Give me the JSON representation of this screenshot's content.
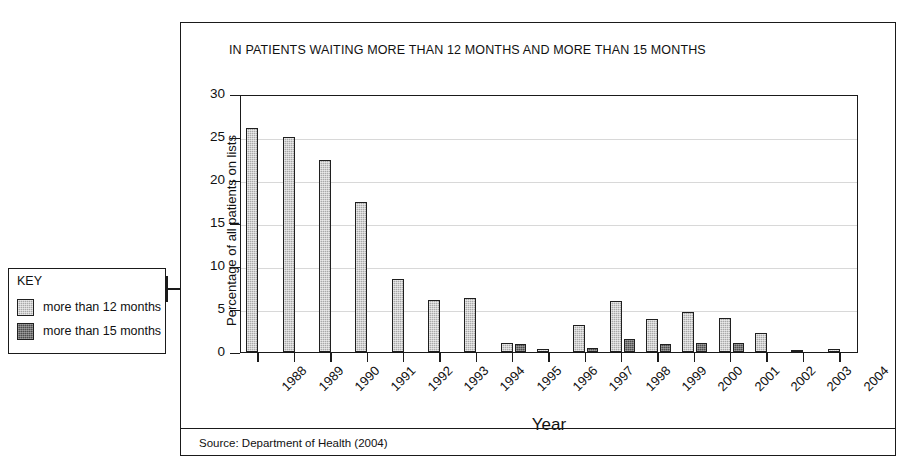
{
  "figure": {
    "title": "IN PATIENTS WAITING MORE THAN 12 MONTHS AND MORE THAN 15 MONTHS",
    "source_note": "Source: Department of Health (2004)"
  },
  "key": {
    "heading": "KEY",
    "items": [
      {
        "label": "more than 12 months",
        "color": "#a9a9a9"
      },
      {
        "label": "more than 15 months",
        "color": "#4c4c4c"
      }
    ]
  },
  "chart_data": {
    "type": "bar",
    "title": "IN PATIENTS WAITING MORE THAN 12 MONTHS AND MORE THAN 15 MONTHS",
    "xlabel": "Year",
    "ylabel": "Percentage of all patients on lists",
    "ylim": [
      0,
      30
    ],
    "yticks": [
      0,
      5,
      10,
      15,
      20,
      25,
      30
    ],
    "grid": true,
    "legend_position": "outside-left",
    "categories": [
      "1988",
      "1989",
      "1990",
      "1991",
      "1992",
      "1993",
      "1994",
      "1995",
      "1996",
      "1997",
      "1998",
      "1999",
      "2000",
      "2001",
      "2002",
      "2003",
      "2004"
    ],
    "series": [
      {
        "name": "more than 12 months",
        "color": "#a9a9a9",
        "values": [
          26.1,
          25.0,
          22.3,
          17.5,
          8.5,
          6.1,
          6.3,
          1.1,
          0.4,
          3.1,
          5.9,
          3.8,
          4.6,
          4.0,
          2.2,
          0.2,
          0.3
        ]
      },
      {
        "name": "more than 15 months",
        "color": "#4c4c4c",
        "values": [
          0,
          0,
          0,
          0,
          0,
          0,
          0,
          0.9,
          0,
          0.5,
          1.5,
          0.9,
          1.1,
          1.0,
          0,
          0,
          0
        ]
      }
    ]
  }
}
